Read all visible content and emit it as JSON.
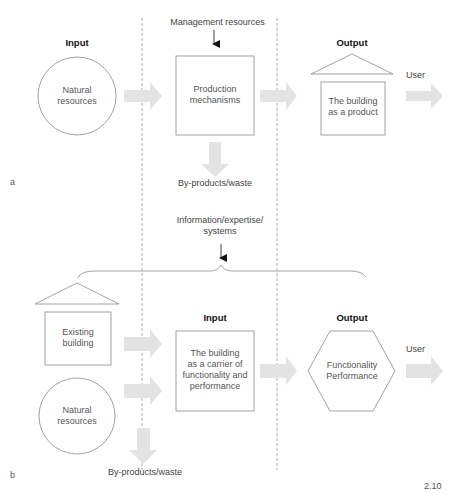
{
  "figure_number": "2.10",
  "diagram_a": {
    "panel_letter": "a",
    "input_heading": "Input",
    "output_heading": "Output",
    "natural_resources": "Natural resources",
    "natural_resources_lines": [
      "Natural",
      "resources"
    ],
    "management_resources": "Management resources",
    "production_mechanisms_lines": [
      "Production",
      "mechanisms"
    ],
    "byproducts": "By-products/waste",
    "building_product_lines": [
      "The building",
      "as a product"
    ],
    "user": "User"
  },
  "diagram_b": {
    "panel_letter": "b",
    "information_lines": [
      "Information/expertise/",
      "systems"
    ],
    "existing_building_lines": [
      "Existing",
      "building"
    ],
    "natural_resources_lines": [
      "Natural",
      "resources"
    ],
    "input_heading": "Input",
    "carrier_lines": [
      "The building",
      "as a carrier of",
      "functionality and",
      "performance"
    ],
    "output_heading": "Output",
    "functionality_lines": [
      "Functionality",
      "Performance"
    ],
    "user": "User",
    "byproducts": "By-products/waste"
  },
  "colors": {
    "line": "#8a8a8a",
    "arrow_fill": "#e3e3e3",
    "dashed": "#9a9a9a",
    "heading": "#111111",
    "text": "#555555"
  }
}
